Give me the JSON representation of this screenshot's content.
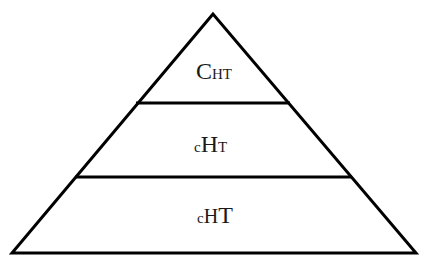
{
  "diagram": {
    "type": "pyramid",
    "stroke_color": "#000000",
    "background": "#ffffff",
    "layers": [
      {
        "position": "top",
        "label_parts": [
          {
            "text": "C",
            "size": "big"
          },
          {
            "text": "H",
            "size": "small"
          },
          {
            "text": "T",
            "size": "small"
          }
        ]
      },
      {
        "position": "middle",
        "label_parts": [
          {
            "text": "c",
            "size": "small"
          },
          {
            "text": "H",
            "size": "big"
          },
          {
            "text": "T",
            "size": "small"
          }
        ]
      },
      {
        "position": "bottom",
        "label_parts": [
          {
            "text": "c",
            "size": "small"
          },
          {
            "text": "H",
            "size": "medium"
          },
          {
            "text": "T",
            "size": "big"
          }
        ]
      }
    ]
  }
}
